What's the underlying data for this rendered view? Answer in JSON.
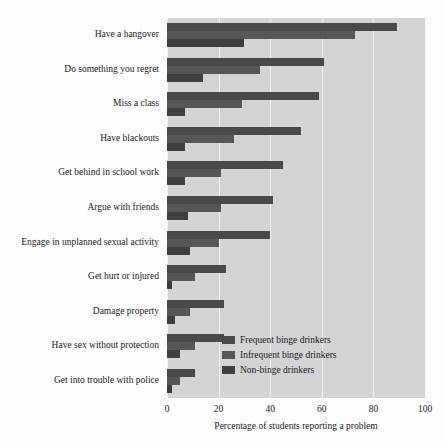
{
  "chart_data": {
    "type": "bar",
    "orientation": "horizontal",
    "title": "",
    "xlabel": "Percentage of students reporting a problem",
    "ylabel": "",
    "xlim": [
      0,
      100
    ],
    "xticks": [
      0,
      20,
      40,
      60,
      80,
      100
    ],
    "xtick_labels": [
      "0",
      "20",
      "40",
      "60",
      "80",
      "100"
    ],
    "grid": true,
    "grid_axis": "x",
    "legend_position": "middle-right-inside",
    "categories": [
      "Have a hangover",
      "Do something you regret",
      "Miss a class",
      "Have blackouts",
      "Get behind in school work",
      "Argue with friends",
      "Engage in unplanned sexual activity",
      "Get hurt or injured",
      "Damage property",
      "Have sex without protection",
      "Get into trouble with police"
    ],
    "series": [
      {
        "name": "Frequent binge drinkers",
        "color": "#494949",
        "values": [
          89,
          61,
          59,
          52,
          45,
          41,
          40,
          23,
          22,
          22,
          11
        ]
      },
      {
        "name": "Infrequent binge drinkers",
        "color": "#565656",
        "values": [
          73,
          36,
          29,
          26,
          21,
          21,
          20,
          11,
          9,
          11,
          5
        ]
      },
      {
        "name": "Non-binge drinkers",
        "color": "#3f3f3f",
        "values": [
          30,
          14,
          7,
          7,
          7,
          8,
          9,
          2,
          3,
          5,
          2
        ]
      }
    ]
  },
  "colors": {
    "plot_background": "#d4d4d4",
    "figure_background": "#fdfdfd",
    "gridline": "#f2f2f2",
    "text": "#1a1a1a"
  }
}
